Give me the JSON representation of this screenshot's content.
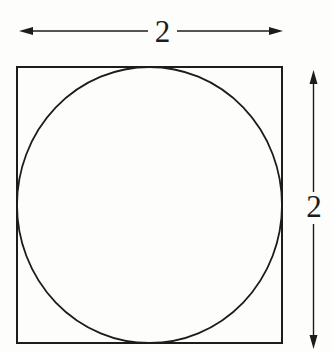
{
  "figure": {
    "colors": {
      "background": "#fdfdfb",
      "line": "#1c1c1c"
    },
    "dimensions": {
      "top": {
        "label": "2"
      },
      "right": {
        "label": "2"
      }
    }
  }
}
